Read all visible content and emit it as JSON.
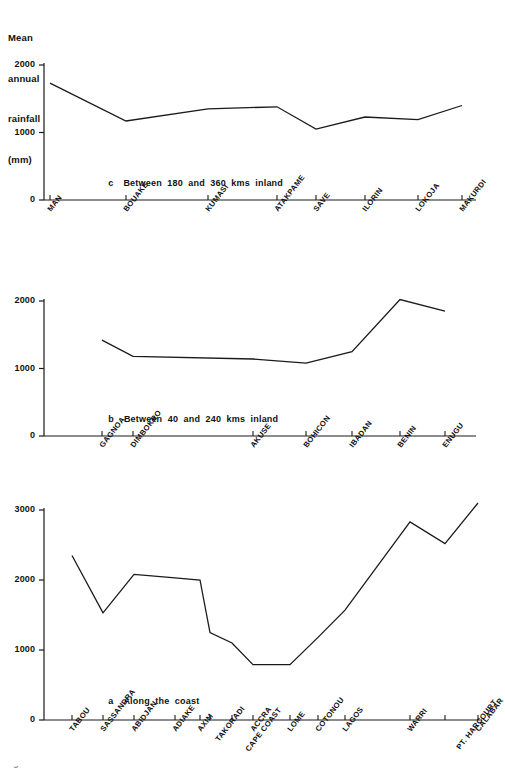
{
  "axis_title": {
    "lines": [
      "Mean",
      "annual",
      "rainfall",
      "(mm)"
    ]
  },
  "footer": {
    "text": "Fig 2.6 Mean annual rainfall at selected stations"
  },
  "chart_data": [
    {
      "id": "panel-c",
      "type": "line",
      "title": "c   Between 180 and 360 kms inland",
      "caption_letter": "c",
      "caption_text": "Between  180  and  360  kms  inland",
      "xlabel": "",
      "ylabel": "Mean annual rainfall (mm)",
      "ylim": [
        0,
        2000
      ],
      "yticks": [
        0,
        1000,
        2000
      ],
      "ytick_labels": [
        "0",
        "1000",
        "2000"
      ],
      "grid": false,
      "legend": "none",
      "line_color": "#1a1a1a",
      "categories": [
        "MAN",
        "BOUAKE",
        "KUMASI",
        "ATAKPAME",
        "SAVE",
        "ILORIN",
        "LOKOJA",
        "MAKURDI"
      ],
      "x_positions": [
        50,
        126,
        208,
        277,
        316,
        365,
        418,
        462
      ],
      "values": [
        1730,
        1170,
        1350,
        1380,
        1050,
        1230,
        1190,
        1400
      ]
    },
    {
      "id": "panel-b",
      "type": "line",
      "title": "b   Between 40 and 240 kms inland",
      "caption_letter": "b",
      "caption_text": "Between  40  and  240  kms  inland",
      "xlabel": "",
      "ylabel": "Mean annual rainfall (mm)",
      "ylim": [
        0,
        2000
      ],
      "yticks": [
        0,
        1000,
        2000
      ],
      "ytick_labels": [
        "0",
        "1000",
        "2000"
      ],
      "grid": false,
      "legend": "none",
      "line_color": "#1a1a1a",
      "categories": [
        "GAGNOA",
        "DIMBOKRO",
        "AKUSE",
        "BOHICON",
        "IBADAN",
        "BENIN",
        "ENUGU"
      ],
      "x_positions": [
        102,
        133,
        253,
        306,
        352,
        400,
        445
      ],
      "values": [
        1420,
        1180,
        1140,
        1080,
        1250,
        2020,
        1850
      ]
    },
    {
      "id": "panel-a",
      "type": "line",
      "title": "a   Along the coast",
      "caption_letter": "a",
      "caption_text": "Along  the  coast",
      "xlabel": "",
      "ylabel": "Mean annual rainfall (mm)",
      "ylim": [
        0,
        3000
      ],
      "yticks": [
        0,
        1000,
        2000,
        3000
      ],
      "ytick_labels": [
        "0",
        "1000",
        "2000",
        "3000"
      ],
      "grid": false,
      "legend": "none",
      "line_color": "#1a1a1a",
      "categories": [
        "TABOU",
        "SASSANDRA",
        "ABIDJAN",
        "ADIAKE",
        "AXIM",
        "TAKORADI",
        "CAPE COAST",
        "ACCRA",
        "LOME",
        "COTONOU",
        "LAGOS",
        "WARRI",
        "PT. HARCOURT",
        "CALABAR"
      ],
      "x_positions": [
        72,
        103,
        134,
        175,
        200,
        210,
        232,
        253,
        290,
        318,
        345,
        410,
        445,
        478
      ],
      "values": [
        2350,
        1530,
        2080,
        2030,
        2000,
        1250,
        1100,
        790,
        790,
        1180,
        1570,
        2830,
        2520,
        3100
      ]
    }
  ]
}
